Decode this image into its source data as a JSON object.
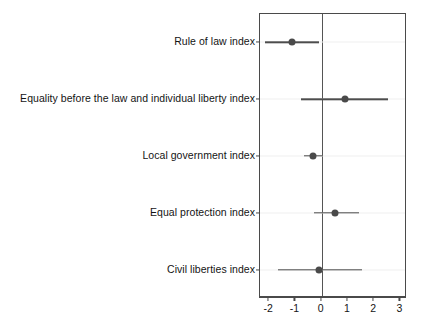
{
  "chart_data": {
    "type": "scatter",
    "orientation": "horizontal",
    "title": "",
    "subtitle": "",
    "xlabel": "",
    "ylabel": "",
    "grid": false,
    "legend": null,
    "xlim": [
      -2.35,
      3.25
    ],
    "xticks": [
      -2,
      -1,
      0,
      1,
      2,
      3
    ],
    "xtick_labels": [
      "-2",
      "-1",
      "0",
      "1",
      "2",
      "3"
    ],
    "reference_line_x": 0,
    "categories": [
      "Rule of law index",
      "Equality before the law and individual liberty index",
      "Local government index",
      "Equal protection index",
      "Civil liberties index"
    ],
    "point_estimates": [
      -1.14,
      0.88,
      -0.33,
      0.51,
      -0.11
    ],
    "ci_low": [
      -2.17,
      -0.77,
      -0.66,
      -0.29,
      -1.65
    ],
    "ci_high": [
      -0.11,
      2.54,
      0.04,
      1.43,
      1.54
    ],
    "marker": "filled-circle",
    "marker_color": "#4a4a4a",
    "line_color": "#4d4d4d",
    "frame_color": "#4a4a4a",
    "points": [
      {
        "category": "Rule of law index",
        "estimate": -1.14,
        "low": -2.17,
        "high": -0.11
      },
      {
        "category": "Equality before the law and individual liberty index",
        "estimate": 0.88,
        "low": -0.77,
        "high": 2.54
      },
      {
        "category": "Local government index",
        "estimate": -0.33,
        "low": -0.66,
        "high": 0.04
      },
      {
        "category": "Equal protection index",
        "estimate": 0.51,
        "low": -0.29,
        "high": 1.43
      },
      {
        "category": "Civil liberties index",
        "estimate": -0.11,
        "low": -1.65,
        "high": 1.54
      }
    ]
  }
}
